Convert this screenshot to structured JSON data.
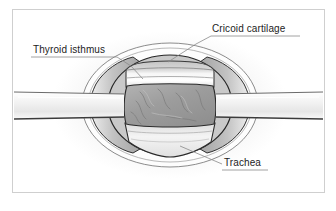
{
  "figure": {
    "type": "anatomical-illustration",
    "frame_color": "#cfcfcf",
    "background_color": "#ffffff",
    "label_text_color": "#1d1d1d",
    "leader_line_color": "#8a8a8a",
    "outline_color": "#2b2b2b"
  },
  "labels": [
    {
      "id": "cricoid-cartilage",
      "text": "Cricoid cartilage",
      "underline": true,
      "leader": "diagonal-down-left"
    },
    {
      "id": "thyroid-isthmus",
      "text": "Thyroid isthmus",
      "underline": true,
      "leader": "diagonal-down-right"
    },
    {
      "id": "trachea",
      "text": "Trachea",
      "underline": true,
      "leader": "diagonal-up-left"
    }
  ],
  "structures": [
    {
      "id": "skin-wound-edge",
      "name": "Skin and wound margin",
      "fill": "#fbfbfb",
      "stroke": "#3a3a3a"
    },
    {
      "id": "subcutaneous-flap",
      "name": "Retracted subcutaneous tissue",
      "fill": "#b9b9b9",
      "stroke": "#3a3a3a"
    },
    {
      "id": "cricoid-cartilage-body",
      "name": "Cricoid cartilage",
      "fill": "#d8d8d8",
      "stroke": "#4a4a4a"
    },
    {
      "id": "thyroid-isthmus-body",
      "name": "Thyroid isthmus",
      "fill": "#9e9e9e",
      "stroke": "#3a3a3a"
    },
    {
      "id": "trachea-body",
      "name": "Trachea",
      "fill": "#e4e4e4",
      "stroke": "#3a3a3a"
    },
    {
      "id": "retractor-blade-left",
      "name": "Left retractor blade",
      "fill": "#f2f2f2",
      "stroke": "#5a5a5a"
    },
    {
      "id": "retractor-blade-right",
      "name": "Right retractor blade",
      "fill": "#f2f2f2",
      "stroke": "#5a5a5a"
    }
  ]
}
